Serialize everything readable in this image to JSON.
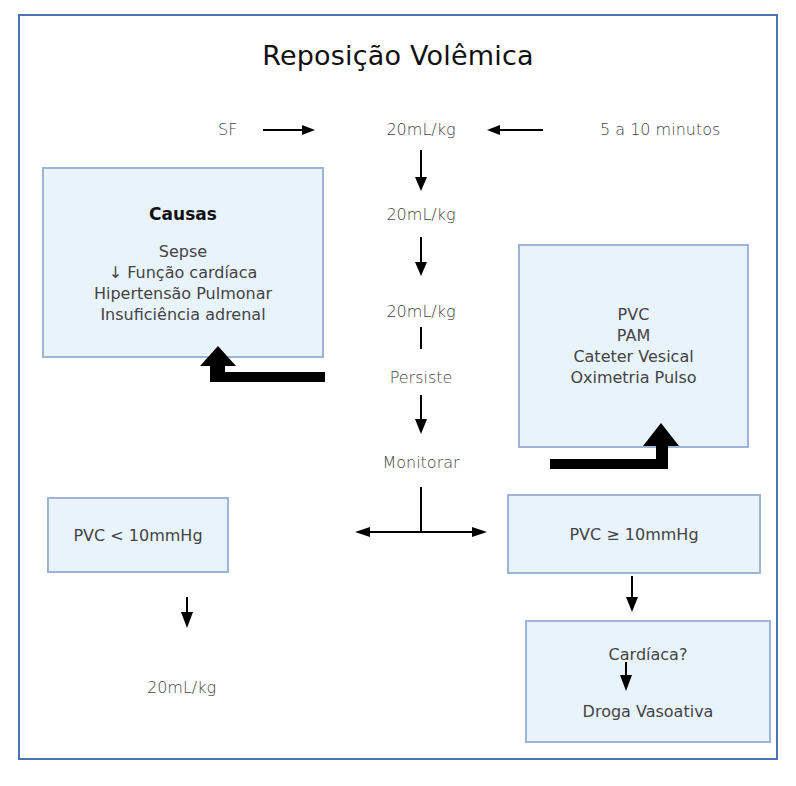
{
  "title": "Reposição Volêmica",
  "top_row": {
    "left_label": "SF",
    "center_label": "20mL/kg",
    "right_label": "5 a 10 minutos"
  },
  "center_column": {
    "step2": "20mL/kg",
    "step3": "20mL/kg",
    "persiste": "Persiste",
    "monitorar": "Monitorar"
  },
  "causas_box": {
    "heading": "Causas",
    "items": [
      "Sepse",
      "↓ Função cardíaca",
      "Hipertensão Pulmonar",
      "Insuficiência adrenal"
    ]
  },
  "monitor_box": {
    "items": [
      "PVC",
      "PAM",
      "Cateter Vesical",
      "Oximetria Pulso"
    ]
  },
  "pvc_low_box": {
    "label": "PVC < 10mmHg"
  },
  "pvc_high_box": {
    "label": "PVC ≥ 10mmHg"
  },
  "pvc_low_result": "20mL/kg",
  "cardiac_box": {
    "question": "Cardíaca?",
    "action": "Droga Vasoativa"
  },
  "colors": {
    "frame_border": "#4a72b8",
    "box_fill": "#e9f3fb",
    "box_border": "#9db4d6",
    "arrow": "#000000"
  }
}
